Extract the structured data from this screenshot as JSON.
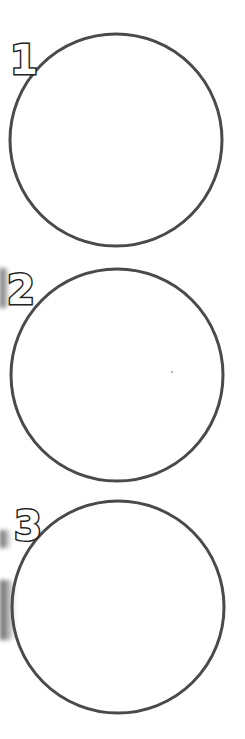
{
  "circles": [
    {
      "label": "1",
      "cx": 116,
      "cy": 140,
      "r": 106
    },
    {
      "label": "2",
      "cx": 117,
      "cy": 375,
      "r": 106
    },
    {
      "label": "3",
      "cx": 118,
      "cy": 607,
      "r": 106
    }
  ],
  "colors": {
    "stroke": "#4a4a4a",
    "background": "#ffffff",
    "label_outline": "#222222"
  }
}
